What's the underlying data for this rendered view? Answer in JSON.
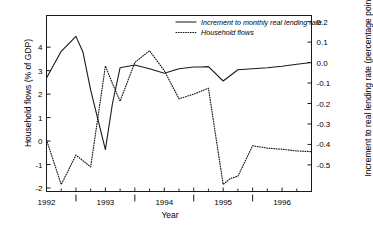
{
  "chart_data": {
    "type": "line",
    "title": "",
    "xlabel": "Year",
    "ylabel_left": "Household flows (% of GDP)",
    "ylabel_right": "Increment to real lending rate (percentage points)",
    "grid": false,
    "legend_position": "top-right",
    "xlim": [
      1992.0,
      1996.5
    ],
    "ylim_left": [
      -2.15,
      5.35
    ],
    "ylim_right": [
      -0.63,
      0.23
    ],
    "x_major_ticks": [
      1992,
      1993,
      1994,
      1995,
      1996
    ],
    "x_major_tick_labels": [
      "1992",
      "1993",
      "1994",
      "1995",
      "1996"
    ],
    "x_minor_ticks": [
      1992.25,
      1992.5,
      1992.75,
      1993.25,
      1993.5,
      1993.75,
      1994.25,
      1994.5,
      1994.75,
      1995.25,
      1995.5,
      1995.75,
      1996.25
    ],
    "x_midyear_ticks": [
      1992.5,
      1993.5,
      1994.5,
      1995.5
    ],
    "yticks_left": [
      -2,
      -1,
      0,
      1,
      2,
      3,
      4
    ],
    "ytick_labels_left": [
      "-2",
      "-1",
      "0",
      "1",
      "2",
      "3",
      "4"
    ],
    "yticks_right": [
      0.2,
      0.1,
      0.0,
      -0.1,
      -0.2,
      -0.3,
      -0.4,
      -0.5
    ],
    "ytick_labels_right": [
      "0.2",
      "0.1",
      "0.0",
      "-0.1",
      "-0.2",
      "-0.3",
      "-0.4",
      "-0.5"
    ],
    "series": [
      {
        "name": "Increment to monthly real lending rate",
        "axis": "right",
        "style": "solid",
        "color": "#1a1a1a",
        "x": [
          1992.0,
          1992.25,
          1992.5,
          1992.62,
          1992.75,
          1993.0,
          1993.12,
          1993.25,
          1993.5,
          1993.75,
          1994.0,
          1994.25,
          1994.5,
          1994.62,
          1994.75,
          1995.0,
          1995.25,
          1995.5,
          1995.75,
          1996.0,
          1996.25,
          1996.5
        ],
        "y": [
          -0.075,
          0.055,
          0.128,
          0.05,
          -0.135,
          -0.425,
          -0.2,
          -0.025,
          -0.012,
          -0.03,
          -0.052,
          -0.03,
          -0.022,
          -0.022,
          -0.02,
          -0.09,
          -0.035,
          -0.03,
          -0.025,
          -0.018,
          -0.008,
          0.0
        ]
      },
      {
        "name": "Household flows",
        "axis": "left",
        "style": "dotted",
        "color": "#1a1a1a",
        "x": [
          1992.0,
          1992.25,
          1992.5,
          1992.75,
          1993.0,
          1993.12,
          1993.25,
          1993.5,
          1993.75,
          1994.0,
          1994.25,
          1994.5,
          1994.75,
          1995.0,
          1995.12,
          1995.25,
          1995.5,
          1995.75,
          1996.0,
          1996.25,
          1996.5
        ],
        "y": [
          0.05,
          -1.85,
          -0.6,
          -1.1,
          3.2,
          2.45,
          1.7,
          3.35,
          3.85,
          3.0,
          1.8,
          2.0,
          2.25,
          -1.85,
          -1.6,
          -1.5,
          -0.2,
          -0.3,
          -0.35,
          -0.42,
          -0.45
        ]
      }
    ],
    "legend": [
      {
        "label": "Increment to monthly real lending rate",
        "style": "solid"
      },
      {
        "label": "Household flows",
        "style": "dotted"
      }
    ]
  }
}
